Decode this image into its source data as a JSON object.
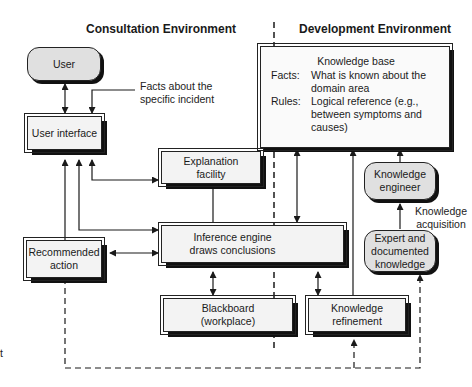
{
  "headings": {
    "consultation": "Consultation Environment",
    "development": "Development Environment"
  },
  "nodes": {
    "user": "User",
    "user_interface": "User interface",
    "explanation_facility": "Explanation facility",
    "inference_engine": "Inference engine draws conclusions",
    "recommended_action": "Recommended action",
    "blackboard": "Blackboard (workplace)",
    "knowledge_refinement": "Knowledge refinement",
    "knowledge_engineer": "Knowledge engineer",
    "expert_knowledge": "Expert and documented knowledge"
  },
  "knowledge_base": {
    "title": "Knowledge base",
    "facts_label": "Facts:",
    "facts_value": "What is known about the domain area",
    "rules_label": "Rules:",
    "rules_value": "Logical reference (e.g., between symptoms and causes)"
  },
  "annotations": {
    "facts_incident": "Facts about the specific incident",
    "knowledge_acquisition": "Knowledge acquisition",
    "left_edge_fragment": "t"
  },
  "colors": {
    "line": "#1a1a1a",
    "box_fill": "#f2f2f2",
    "rounded_fill": "#e0e0e0"
  }
}
